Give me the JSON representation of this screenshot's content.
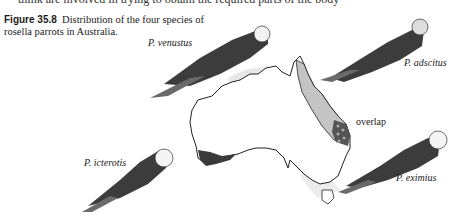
{
  "page": {
    "top_text_fragment": "think are involved in trying to obtain the required parts of the body"
  },
  "figure": {
    "number": "Figure 35.8",
    "caption": "Distribution of the four species of rosella parrots in Australia.",
    "species": [
      {
        "name": "P. venustus",
        "range": "northern Australia"
      },
      {
        "name": "P. adscitus",
        "range": "north-eastern Australia"
      },
      {
        "name": "P. icterotis",
        "range": "south-western Australia"
      },
      {
        "name": "P. eximius",
        "range": "south-eastern Australia"
      }
    ],
    "overlap_label": "overlap",
    "colors": {
      "outline": "#222222",
      "dark_range": "#3a3a3a",
      "light_range": "#c8c8c8",
      "pale_range": "#e6e6e6"
    }
  }
}
